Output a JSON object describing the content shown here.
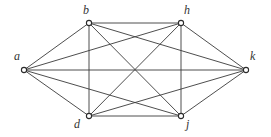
{
  "figure": {
    "name": "complete-graph-k6",
    "width": 271,
    "height": 137,
    "background_color": "#ffffff",
    "edge_color": "#3a3a3a",
    "vertex_fill_color": "#ffffff",
    "vertex_stroke_color": "#2b2b2b",
    "label_color": "#333333"
  },
  "graph_data": {
    "type": "graph",
    "layout": "hexagonal",
    "directed": false,
    "vertex_count": 6,
    "edge_count": 15,
    "vertices": [
      {
        "id": "a",
        "label": "a",
        "x": 24,
        "y": 70,
        "label_x": 14,
        "label_y": 50
      },
      {
        "id": "b",
        "label": "b",
        "x": 89,
        "y": 23,
        "label_x": 83,
        "label_y": 4
      },
      {
        "id": "h",
        "label": "h",
        "x": 181,
        "y": 23,
        "label_x": 184,
        "label_y": 4
      },
      {
        "id": "k",
        "label": "k",
        "x": 246,
        "y": 70,
        "label_x": 250,
        "label_y": 50
      },
      {
        "id": "j",
        "label": "j",
        "x": 181,
        "y": 116,
        "label_x": 186,
        "label_y": 118
      },
      {
        "id": "d",
        "label": "d",
        "x": 89,
        "y": 116,
        "label_x": 74,
        "label_y": 118
      }
    ],
    "edges": [
      {
        "from": "a",
        "to": "b"
      },
      {
        "from": "a",
        "to": "h"
      },
      {
        "from": "a",
        "to": "k"
      },
      {
        "from": "a",
        "to": "j"
      },
      {
        "from": "a",
        "to": "d"
      },
      {
        "from": "b",
        "to": "h"
      },
      {
        "from": "b",
        "to": "k"
      },
      {
        "from": "b",
        "to": "j"
      },
      {
        "from": "b",
        "to": "d"
      },
      {
        "from": "h",
        "to": "k"
      },
      {
        "from": "h",
        "to": "j"
      },
      {
        "from": "h",
        "to": "d"
      },
      {
        "from": "k",
        "to": "j"
      },
      {
        "from": "k",
        "to": "d"
      },
      {
        "from": "j",
        "to": "d"
      }
    ]
  }
}
